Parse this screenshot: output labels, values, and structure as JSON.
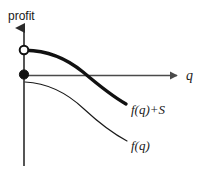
{
  "figure": {
    "type": "line-diagram",
    "background_color": "#ffffff",
    "axes": {
      "vertical": {
        "label": "profit",
        "label_x": 8,
        "label_y": 20,
        "x": 24,
        "y_top": 26,
        "y_bottom": 166,
        "arrow": "up",
        "color": "#2b2b2b",
        "width": 1.6
      },
      "horizontal": {
        "label": "q",
        "label_x": 186,
        "label_y": 80,
        "y": 75,
        "x_left": 24,
        "x_right": 179,
        "arrow": "right",
        "color": "#4a4a4a",
        "width": 1.3
      }
    },
    "markers": [
      {
        "name": "open-circle-marker",
        "style": "open",
        "cx": 24,
        "cy": 50,
        "r": 4.6,
        "stroke": "#111111",
        "fill": "#ffffff",
        "stroke_width": 2.0
      },
      {
        "name": "filled-circle-marker",
        "style": "filled",
        "cx": 24,
        "cy": 74.5,
        "r": 4.6,
        "stroke": "#111111",
        "fill": "#111111",
        "stroke_width": 1.0
      }
    ],
    "curves": [
      {
        "name": "upper-curve",
        "label": "f(q)+S",
        "label_x": 131,
        "label_y": 114,
        "weight": "thick",
        "stroke": "#111111",
        "stroke_width": 3.4,
        "path": "M 25.5 50.2 C 45 50.5 66 58 83 72 C 96 83 112 96 126 104",
        "crosses_axis_at_x": 106
      },
      {
        "name": "lower-curve",
        "label": "f(q)",
        "label_x": 131,
        "label_y": 150,
        "weight": "thin",
        "stroke": "#1a1a1a",
        "stroke_width": 1.15,
        "path": "M 25 82 C 46 83 66 92 84 109 C 98 122 112 133 127 141"
      }
    ]
  }
}
